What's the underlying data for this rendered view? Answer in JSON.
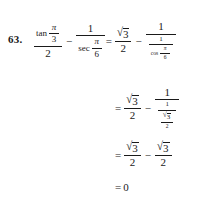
{
  "problem": {
    "number": "63.",
    "operators": {
      "minus": "−",
      "equals": "=",
      "radical": "√"
    },
    "symbols": {
      "pi": "π",
      "tan": "tan",
      "sec": "sec",
      "cos": "cos"
    },
    "line1": {
      "term1": {
        "numerator_fn": "tan",
        "numerator_arg_num": "π",
        "numerator_arg_den": "3",
        "denominator": "2"
      },
      "operator": "−",
      "term2": {
        "numerator": "1",
        "denominator_fn": "sec",
        "denominator_arg_num": "π",
        "denominator_arg_den": "6"
      },
      "equals": "=",
      "rhs_term1": {
        "radicand": "3",
        "denominator": "2"
      },
      "rhs_operator": "−",
      "rhs_term2": {
        "numerator": "1",
        "inner_numerator": "1",
        "inner_fn": "cos",
        "inner_arg_num": "π",
        "inner_arg_den": "6"
      }
    },
    "line2": {
      "equals": "=",
      "term1": {
        "radicand": "3",
        "denominator": "2"
      },
      "operator": "−",
      "term2": {
        "numerator": "1",
        "inner_numerator": "1",
        "inner_radicand": "3",
        "inner_denominator": "2"
      }
    },
    "line3": {
      "equals": "=",
      "term1": {
        "radicand": "3",
        "denominator": "2"
      },
      "operator": "−",
      "term2": {
        "radicand": "3",
        "denominator": "2"
      }
    },
    "line4": {
      "equals": "=",
      "value": "0"
    }
  }
}
